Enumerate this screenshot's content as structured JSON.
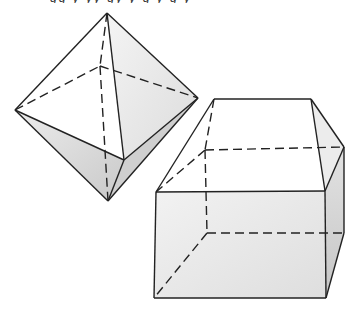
{
  "figure": {
    "caption_clipped": "gg y yy gy y  g  y  g y",
    "colors": {
      "line": "#222222",
      "shade_light": "#e6e6e6",
      "shade_mid": "#d2d2d2",
      "shade_dark": "#bdbdbd",
      "background": "#ffffff"
    },
    "shapes": [
      {
        "name": "octahedron",
        "vertices": {
          "top": [
            107,
            13
          ],
          "left": [
            15,
            110
          ],
          "right": [
            198,
            98
          ],
          "back": [
            100,
            66
          ],
          "front": [
            124,
            160
          ],
          "bottom": [
            108,
            201
          ]
        }
      },
      {
        "name": "prism",
        "vertices": {
          "ridge_left": [
            214,
            99
          ],
          "ridge_right": [
            311,
            99
          ],
          "front_top_left": [
            156,
            192
          ],
          "front_top_right": [
            325,
            191
          ],
          "front_bottom_left": [
            154,
            298
          ],
          "front_bottom_right": [
            326,
            298
          ],
          "back_top_left": [
            205,
            150
          ],
          "back_top_right": [
            344,
            147
          ],
          "back_bottom_left": [
            207,
            233
          ],
          "back_bottom_right": [
            344,
            233
          ]
        }
      }
    ]
  }
}
